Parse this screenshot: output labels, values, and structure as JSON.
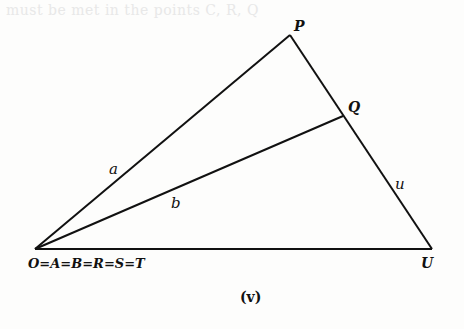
{
  "bleed_through_text": "must be met in the points C, R, Q",
  "diagram": {
    "caption": "(v)",
    "points": {
      "P": {
        "label": "P",
        "x": 290,
        "y": 35
      },
      "Q": {
        "label": "Q",
        "x": 343,
        "y": 116
      },
      "O": {
        "label": "O=A=B=R=S=T",
        "x": 35,
        "y": 249
      },
      "U": {
        "label": "U",
        "x": 432,
        "y": 249
      }
    },
    "segment_labels": {
      "a": "a",
      "b": "b",
      "u": "u"
    },
    "segments": [
      {
        "from": "O",
        "to": "P",
        "label": "a"
      },
      {
        "from": "O",
        "to": "Q",
        "label": "b"
      },
      {
        "from": "P",
        "to": "U",
        "label": "u"
      },
      {
        "from": "O",
        "to": "U",
        "label": ""
      }
    ],
    "line_color": "#111111"
  }
}
